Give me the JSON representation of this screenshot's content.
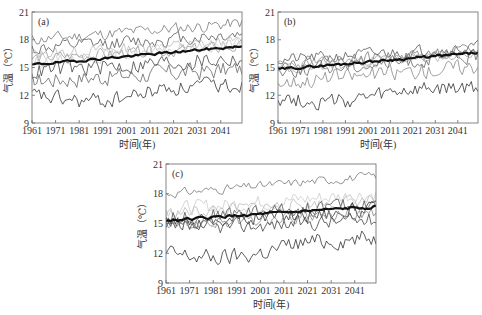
{
  "chart_data": [
    {
      "type": "line",
      "panel_label": "(a)",
      "xlabel": "时间(年)",
      "ylabel": "气温（℃）",
      "xlim": [
        1961,
        2050
      ],
      "ylim": [
        9,
        21
      ],
      "xticks": [
        1961,
        1971,
        1981,
        1991,
        2001,
        2011,
        2021,
        2031,
        2041
      ],
      "yticks": [
        9,
        12,
        15,
        18,
        21
      ],
      "grid": false,
      "legend": "none",
      "series": [
        {
          "name": "model-1",
          "color": "#777777",
          "width": 0.8,
          "start": 18.0,
          "end": 19.8,
          "noise": 0.6,
          "seed": 11
        },
        {
          "name": "model-2",
          "color": "#555555",
          "width": 0.8,
          "start": 17.0,
          "end": 18.6,
          "noise": 0.7,
          "seed": 12
        },
        {
          "name": "model-3",
          "color": "#bbbbbb",
          "width": 0.8,
          "start": 16.4,
          "end": 17.8,
          "noise": 0.6,
          "seed": 13
        },
        {
          "name": "model-4",
          "color": "#999999",
          "width": 0.8,
          "start": 16.0,
          "end": 17.2,
          "noise": 0.6,
          "seed": 14
        },
        {
          "name": "model-5",
          "color": "#cccccc",
          "width": 0.8,
          "start": 15.6,
          "end": 17.6,
          "noise": 0.6,
          "seed": 15
        },
        {
          "name": "model-6",
          "color": "#444444",
          "width": 0.8,
          "start": 14.6,
          "end": 16.0,
          "noise": 0.9,
          "seed": 16
        },
        {
          "name": "model-7",
          "color": "#666666",
          "width": 0.8,
          "start": 13.6,
          "end": 14.8,
          "noise": 0.9,
          "seed": 17
        },
        {
          "name": "model-8",
          "color": "#333333",
          "width": 0.8,
          "start": 12.0,
          "end": 13.2,
          "noise": 0.8,
          "seed": 18,
          "dip": -1.0
        },
        {
          "name": "ensemble-mean",
          "color": "#111111",
          "width": 2.2,
          "start": 15.3,
          "end": 17.3,
          "noise": 0.12,
          "seed": 19
        }
      ]
    },
    {
      "type": "line",
      "panel_label": "(b)",
      "xlabel": "时间(年)",
      "ylabel": "气温（℃）",
      "xlim": [
        1961,
        2050
      ],
      "ylim": [
        9,
        21
      ],
      "xticks": [
        1961,
        1971,
        1981,
        1991,
        2001,
        2011,
        2021,
        2031,
        2041
      ],
      "yticks": [
        9,
        12,
        15,
        18,
        21
      ],
      "grid": false,
      "legend": "none",
      "series": [
        {
          "name": "model-1",
          "color": "#555555",
          "width": 0.8,
          "start": 15.8,
          "end": 17.2,
          "noise": 0.6,
          "seed": 21
        },
        {
          "name": "model-2",
          "color": "#777777",
          "width": 0.8,
          "start": 15.4,
          "end": 16.8,
          "noise": 0.6,
          "seed": 22
        },
        {
          "name": "model-3",
          "color": "#999999",
          "width": 0.8,
          "start": 15.2,
          "end": 16.6,
          "noise": 0.5,
          "seed": 23
        },
        {
          "name": "model-4",
          "color": "#aaaaaa",
          "width": 0.8,
          "start": 14.8,
          "end": 16.4,
          "noise": 0.5,
          "seed": 24
        },
        {
          "name": "model-5",
          "color": "#666666",
          "width": 0.8,
          "start": 14.6,
          "end": 16.2,
          "noise": 0.7,
          "seed": 25
        },
        {
          "name": "model-6",
          "color": "#888888",
          "width": 0.8,
          "start": 13.4,
          "end": 15.2,
          "noise": 0.8,
          "seed": 26
        },
        {
          "name": "model-7",
          "color": "#333333",
          "width": 0.8,
          "start": 11.8,
          "end": 12.8,
          "noise": 0.8,
          "seed": 27,
          "dip": -0.8
        },
        {
          "name": "ensemble-mean",
          "color": "#111111",
          "width": 2.2,
          "start": 14.8,
          "end": 16.6,
          "noise": 0.12,
          "seed": 29
        }
      ]
    },
    {
      "type": "line",
      "panel_label": "(c)",
      "xlabel": "时间(年)",
      "ylabel": "气温（℃）",
      "xlim": [
        1961,
        2050
      ],
      "ylim": [
        9,
        21
      ],
      "xticks": [
        1961,
        1971,
        1981,
        1991,
        2001,
        2011,
        2021,
        2031,
        2041
      ],
      "yticks": [
        9,
        12,
        15,
        18,
        21
      ],
      "grid": false,
      "legend": "none",
      "series": [
        {
          "name": "model-1",
          "color": "#777777",
          "width": 0.8,
          "start": 18.0,
          "end": 19.8,
          "noise": 0.4,
          "seed": 31
        },
        {
          "name": "model-2",
          "color": "#cccccc",
          "width": 0.8,
          "start": 16.4,
          "end": 18.0,
          "noise": 0.7,
          "seed": 32
        },
        {
          "name": "model-3",
          "color": "#bbbbbb",
          "width": 0.8,
          "start": 16.0,
          "end": 17.4,
          "noise": 0.6,
          "seed": 33
        },
        {
          "name": "model-4",
          "color": "#555555",
          "width": 0.8,
          "start": 15.6,
          "end": 17.0,
          "noise": 0.7,
          "seed": 34
        },
        {
          "name": "model-5",
          "color": "#333333",
          "width": 0.8,
          "start": 15.0,
          "end": 16.4,
          "noise": 0.7,
          "seed": 35
        },
        {
          "name": "model-6",
          "color": "#888888",
          "width": 0.8,
          "start": 14.8,
          "end": 16.0,
          "noise": 0.6,
          "seed": 36
        },
        {
          "name": "model-7",
          "color": "#444444",
          "width": 0.8,
          "start": 14.4,
          "end": 15.4,
          "noise": 0.7,
          "seed": 37
        },
        {
          "name": "model-8",
          "color": "#333333",
          "width": 0.8,
          "start": 12.0,
          "end": 13.6,
          "noise": 0.8,
          "seed": 38,
          "dip": -0.9
        },
        {
          "name": "ensemble-mean",
          "color": "#111111",
          "width": 2.2,
          "start": 15.3,
          "end": 16.7,
          "noise": 0.12,
          "seed": 39
        }
      ]
    }
  ],
  "layout": {
    "panels": [
      {
        "id": "a",
        "left": 32,
        "top": 12,
        "right": 242,
        "bottom": 123
      },
      {
        "id": "b",
        "left": 278,
        "top": 12,
        "right": 478,
        "bottom": 123
      },
      {
        "id": "c",
        "left": 166,
        "top": 164,
        "right": 376,
        "bottom": 283
      }
    ]
  }
}
